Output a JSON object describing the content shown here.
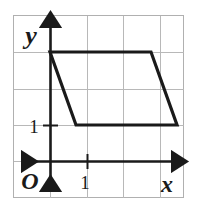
{
  "figure": {
    "background_color": "#ffffff",
    "border_color": "#b0b0b0",
    "grid_color": "#b8b8b8",
    "axis_color": "#1a1a1a",
    "shape_color": "#1a1a1a",
    "frame": {
      "x": 13,
      "y": 15,
      "width": 171,
      "height": 183
    },
    "grid": {
      "cell_size": 36.5,
      "vertical_lines_px": [
        13,
        50,
        87,
        123,
        160,
        184
      ],
      "horizontal_lines_px": [
        15,
        52,
        89,
        125,
        161,
        198
      ],
      "visible": true
    },
    "axes": {
      "origin_px": {
        "x": 50,
        "y": 161
      },
      "x_axis": {
        "label": "x",
        "label_px": {
          "x": 166,
          "y": 186
        },
        "start_px": {
          "x": 18,
          "y": 161
        },
        "end_px": {
          "x": 180,
          "y": 161
        },
        "arrow_both_ends": true
      },
      "y_axis": {
        "label": "y",
        "label_px": {
          "x": 31,
          "y": 37
        },
        "start_px": {
          "x": 50,
          "y": 193
        },
        "end_px": {
          "x": 50,
          "y": 20
        },
        "arrow_both_ends": true
      },
      "origin_label": "O",
      "origin_label_px": {
        "x": 29,
        "y": 182
      }
    },
    "ticks": [
      {
        "axis": "x",
        "label": "1",
        "value": 1,
        "px": {
          "x": 87,
          "y": 161
        },
        "label_px": {
          "x": 84,
          "y": 185
        }
      },
      {
        "axis": "y",
        "label": "1",
        "value": 1,
        "px": {
          "x": 50,
          "y": 125
        },
        "label_px": {
          "x": 34,
          "y": 131
        }
      }
    ],
    "shape": {
      "name": "parallelogram",
      "stroke_width": 3,
      "filled": false,
      "vertices_units": [
        {
          "x": 0,
          "y": 3
        },
        {
          "x": 3,
          "y": 3
        },
        {
          "x": 4,
          "y": 1
        },
        {
          "x": 1,
          "y": 1
        }
      ],
      "vertices_px": [
        {
          "x": 50,
          "y": 52
        },
        {
          "x": 151,
          "y": 52
        },
        {
          "x": 177,
          "y": 125
        },
        {
          "x": 76,
          "y": 125
        }
      ]
    }
  }
}
